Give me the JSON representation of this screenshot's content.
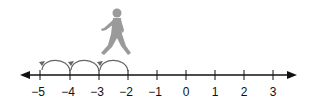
{
  "diagram": {
    "type": "number-line",
    "min": -5,
    "max": 3,
    "ticks": [
      {
        "value": -5,
        "label": "−5",
        "x": 40
      },
      {
        "value": -4,
        "label": "−4",
        "x": 70
      },
      {
        "value": -3,
        "label": "−3",
        "x": 99
      },
      {
        "value": -2,
        "label": "−2",
        "x": 128
      },
      {
        "value": -1,
        "label": "−1",
        "x": 157
      },
      {
        "value": 0,
        "label": "0",
        "x": 186
      },
      {
        "value": 1,
        "label": "1",
        "x": 215
      },
      {
        "value": 2,
        "label": "2",
        "x": 244
      },
      {
        "value": 3,
        "label": "3",
        "x": 273
      }
    ],
    "jumps": [
      {
        "from": -2,
        "to": -3
      },
      {
        "from": -3,
        "to": -4
      },
      {
        "from": -4,
        "to": -5
      }
    ],
    "figure": {
      "icon": "walking-person-icon",
      "position_between": [
        -3,
        -2
      ]
    },
    "colors": {
      "line": "#111111",
      "arcs": "#666666",
      "figure": "#9a9a9a",
      "labels": "#111111"
    }
  }
}
